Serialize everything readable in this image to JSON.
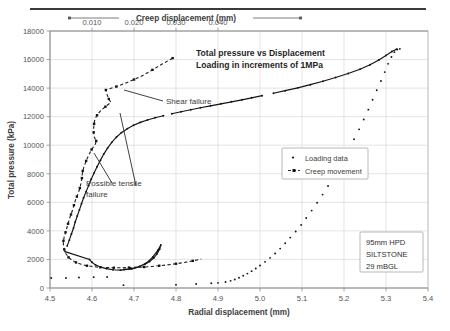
{
  "chart_data": {
    "type": "scatter",
    "title": "Total pressure vs Displacement",
    "subtitle": "Loading in increments of 1MPa",
    "xlabel": "Radial displacement (mm)",
    "ylabel": "Total pressure (kPa)",
    "top_axis_label": "Creep displacement (mm)",
    "xlim": [
      4.5,
      5.4
    ],
    "ylim": [
      0,
      18000
    ],
    "top_xlim": [
      0.0,
      0.09
    ],
    "grid": true,
    "legend_position": "center-right",
    "xticks": [
      "4.5",
      "4.6",
      "4.7",
      "4.8",
      "4.9",
      "5.0",
      "5.1",
      "5.2",
      "5.3",
      "5.4"
    ],
    "xtick_values": [
      4.5,
      4.6,
      4.7,
      4.8,
      4.9,
      5.0,
      5.1,
      5.2,
      5.3,
      5.4
    ],
    "yticks": [
      "0",
      "2000",
      "4000",
      "6000",
      "8000",
      "10000",
      "12000",
      "14000",
      "16000",
      "18000"
    ],
    "ytick_values": [
      0,
      2000,
      4000,
      6000,
      8000,
      10000,
      12000,
      14000,
      16000,
      18000
    ],
    "top_xticks": [
      "0.010",
      "0.020",
      "0.030",
      "0.040"
    ],
    "top_xtick_values": [
      0.01,
      0.02,
      0.03,
      0.04
    ],
    "series": [
      {
        "name": "Loading data",
        "marker": "dot",
        "axis": "bottom",
        "points": [
          [
            4.503,
            700
          ],
          [
            4.538,
            700
          ],
          [
            4.569,
            740
          ],
          [
            4.604,
            760
          ],
          [
            4.636,
            770
          ],
          [
            4.675,
            200
          ],
          [
            4.8,
            230
          ],
          [
            4.848,
            280
          ],
          [
            4.884,
            330
          ],
          [
            4.9,
            360
          ],
          [
            4.918,
            420
          ],
          [
            4.93,
            500
          ],
          [
            4.94,
            600
          ],
          [
            4.95,
            720
          ],
          [
            4.96,
            860
          ],
          [
            4.97,
            1010
          ],
          [
            4.98,
            1180
          ],
          [
            4.99,
            1370
          ],
          [
            5.0,
            1580
          ],
          [
            5.012,
            1830
          ],
          [
            5.024,
            2110
          ],
          [
            5.036,
            2420
          ],
          [
            5.048,
            2760
          ],
          [
            5.06,
            3130
          ],
          [
            5.072,
            3530
          ],
          [
            5.085,
            3960
          ],
          [
            5.098,
            4420
          ],
          [
            5.11,
            4900
          ],
          [
            5.123,
            5420
          ],
          [
            5.136,
            5970
          ],
          [
            5.149,
            6540
          ],
          [
            5.162,
            7140
          ],
          [
            5.175,
            7760
          ],
          [
            5.188,
            8410
          ],
          [
            5.2,
            9070
          ],
          [
            5.212,
            9740
          ],
          [
            5.224,
            10420
          ],
          [
            5.236,
            11110
          ],
          [
            5.247,
            11800
          ],
          [
            5.258,
            12490
          ],
          [
            5.268,
            13180
          ],
          [
            5.278,
            13850
          ],
          [
            5.288,
            14500
          ],
          [
            5.297,
            15120
          ],
          [
            5.305,
            15700
          ],
          [
            5.313,
            16180
          ],
          [
            5.32,
            16520
          ],
          [
            5.327,
            16700
          ],
          [
            5.333,
            16750
          ],
          [
            4.676,
            1300
          ],
          [
            4.69,
            1350
          ],
          [
            4.702,
            1420
          ],
          [
            4.714,
            1520
          ],
          [
            4.726,
            1660
          ],
          [
            4.737,
            1850
          ],
          [
            4.747,
            2100
          ],
          [
            4.755,
            2400
          ],
          [
            4.761,
            2720
          ],
          [
            4.764,
            3020
          ],
          [
            4.757,
            2650
          ],
          [
            4.745,
            2180
          ],
          [
            4.73,
            1760
          ],
          [
            4.712,
            1480
          ],
          [
            4.695,
            1340
          ],
          [
            4.668,
            1250
          ],
          [
            4.65,
            1280
          ],
          [
            4.634,
            1360
          ],
          [
            4.62,
            1470
          ],
          [
            4.608,
            1620
          ],
          [
            4.6,
            1800
          ],
          [
            4.594,
            2000
          ],
          [
            4.536,
            2550
          ],
          [
            4.541,
            2950
          ],
          [
            4.546,
            3350
          ],
          [
            4.551,
            3780
          ],
          [
            4.556,
            4200
          ],
          [
            4.56,
            4620
          ],
          [
            4.565,
            5040
          ],
          [
            4.57,
            5470
          ],
          [
            4.575,
            5900
          ],
          [
            4.58,
            6320
          ],
          [
            4.586,
            6750
          ],
          [
            4.592,
            7180
          ],
          [
            4.598,
            7620
          ],
          [
            4.605,
            8060
          ],
          [
            4.612,
            8500
          ],
          [
            4.62,
            8940
          ],
          [
            4.628,
            9380
          ],
          [
            4.637,
            9800
          ],
          [
            4.647,
            10200
          ],
          [
            4.658,
            10560
          ],
          [
            4.67,
            10880
          ],
          [
            4.684,
            11160
          ],
          [
            4.699,
            11400
          ],
          [
            4.715,
            11600
          ],
          [
            4.732,
            11770
          ],
          [
            4.75,
            11920
          ],
          [
            4.77,
            12060
          ],
          [
            4.79,
            12200
          ],
          [
            4.812,
            12340
          ],
          [
            4.835,
            12480
          ],
          [
            4.858,
            12620
          ],
          [
            4.882,
            12760
          ],
          [
            4.907,
            12900
          ],
          [
            4.932,
            13040
          ],
          [
            4.957,
            13180
          ],
          [
            4.98,
            13320
          ],
          [
            5.005,
            13470
          ],
          [
            5.032,
            13640
          ],
          [
            5.06,
            13820
          ],
          [
            5.09,
            14020
          ],
          [
            5.12,
            14240
          ],
          [
            5.15,
            14480
          ],
          [
            5.18,
            14740
          ],
          [
            5.21,
            15020
          ],
          [
            5.238,
            15320
          ],
          [
            5.262,
            15640
          ],
          [
            5.283,
            15970
          ],
          [
            5.3,
            16290
          ],
          [
            5.314,
            16560
          ],
          [
            5.325,
            16720
          ]
        ]
      },
      {
        "name": "Creep movement",
        "marker": "square-dashed-line",
        "axis": "top",
        "points": [
          [
            0.0292,
            16100
          ],
          [
            0.0268,
            15700
          ],
          [
            0.0244,
            15280
          ],
          [
            0.0222,
            14900
          ],
          [
            0.02,
            14600
          ],
          [
            0.0178,
            14330
          ],
          [
            0.0158,
            14110
          ],
          [
            0.0142,
            13960
          ],
          [
            0.0133,
            13870
          ],
          [
            0.0136,
            13540
          ],
          [
            0.014,
            13240
          ],
          [
            0.0145,
            13000
          ],
          [
            0.0132,
            12700
          ],
          [
            0.012,
            12400
          ],
          [
            0.0112,
            12100
          ],
          [
            0.0107,
            11830
          ],
          [
            0.0105,
            11500
          ],
          [
            0.0104,
            11180
          ],
          [
            0.0104,
            10900
          ],
          [
            0.0105,
            10600
          ],
          [
            0.011,
            10300
          ],
          [
            0.0108,
            10080
          ],
          [
            0.0099,
            9700
          ],
          [
            0.0092,
            9300
          ],
          [
            0.0086,
            8900
          ],
          [
            0.0081,
            8500
          ],
          [
            0.0078,
            8200
          ],
          [
            0.0077,
            8000
          ],
          [
            0.0076,
            7700
          ],
          [
            0.0074,
            7350
          ],
          [
            0.0071,
            7000
          ],
          [
            0.0068,
            6700
          ],
          [
            0.0064,
            6400
          ],
          [
            0.006,
            6100
          ],
          [
            0.0057,
            5800
          ],
          [
            0.0054,
            5480
          ],
          [
            0.005,
            5150
          ],
          [
            0.0046,
            4820
          ],
          [
            0.0043,
            4500
          ],
          [
            0.004,
            4200
          ],
          [
            0.0037,
            3900
          ],
          [
            0.0034,
            3600
          ],
          [
            0.0032,
            3300
          ],
          [
            0.0032,
            3000
          ],
          [
            0.0034,
            2700
          ],
          [
            0.0038,
            2400
          ],
          [
            0.0044,
            2150
          ],
          [
            0.0052,
            1950
          ],
          [
            0.0062,
            1790
          ],
          [
            0.0074,
            1660
          ],
          [
            0.0088,
            1560
          ],
          [
            0.0104,
            1490
          ],
          [
            0.012,
            1450
          ],
          [
            0.0136,
            1430
          ],
          [
            0.0152,
            1420
          ],
          [
            0.017,
            1420
          ],
          [
            0.0188,
            1430
          ],
          [
            0.0206,
            1450
          ],
          [
            0.0224,
            1470
          ],
          [
            0.0242,
            1510
          ],
          [
            0.026,
            1560
          ],
          [
            0.028,
            1620
          ],
          [
            0.03,
            1700
          ],
          [
            0.032,
            1790
          ],
          [
            0.034,
            1900
          ],
          [
            0.036,
            2020
          ]
        ]
      }
    ],
    "annotations": [
      {
        "text": "Shear failure",
        "target": "creep curve near 13900 kPa"
      },
      {
        "text": "Possible tensile failure",
        "line1": "Possible tensile",
        "line2": "failure",
        "target": "creep curve near 10000 kPa"
      }
    ],
    "info_box": {
      "lines": [
        "95mm HPD",
        "SILTSTONE",
        "29 mBGL"
      ]
    },
    "legend": {
      "entries": [
        {
          "label": "Loading data",
          "marker": "dot"
        },
        {
          "label": "Creep movement",
          "marker": "line-marker"
        }
      ]
    },
    "colors": {
      "data": "#141414",
      "grid": "#d9d9d9",
      "text": "#3d3d3d",
      "frame": "#bfbfbf"
    }
  }
}
